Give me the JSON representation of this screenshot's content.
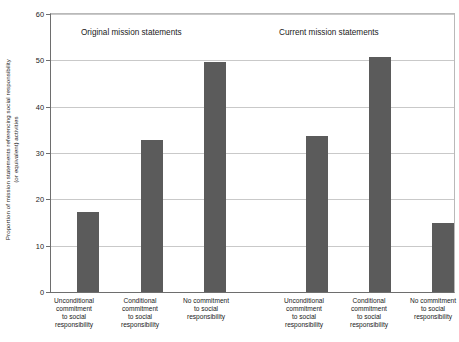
{
  "chart_data": {
    "type": "bar",
    "title": "",
    "xlabel": "",
    "ylabel_line1": "Proportion of mission statements referencing social responsibility",
    "ylabel_line2": "(or equivalent) activities",
    "ylim": [
      0,
      60
    ],
    "yticks": [
      0,
      10,
      20,
      30,
      40,
      50,
      60
    ],
    "ytick_labels": [
      "0",
      "10",
      "20",
      "30",
      "40",
      "50",
      "60"
    ],
    "grid": true,
    "legend": "none",
    "bar_color": "#5b5b5b",
    "grid_color": "#c9c9c9",
    "axis_color": "#6e6e6e",
    "groups": [
      {
        "name": "original",
        "title": "Original mission statements",
        "categories": [
          "Unconditional commitment to social responsibility",
          "Conditional commitment to social responsibility",
          "No commitment to social responsibility"
        ],
        "values": [
          17.3,
          32.9,
          49.6
        ]
      },
      {
        "name": "current",
        "title": "Current mission statements",
        "categories": [
          "Unconditional commitment to social responsibility",
          "Conditional commitment to social responsibility",
          "No commitment to social responsibility"
        ],
        "values": [
          33.6,
          50.8,
          14.9
        ]
      }
    ],
    "categories_flat": [
      "Unconditional commitment to social responsibility",
      "Conditional commitment to social responsibility",
      "No commitment to social responsibility",
      "Unconditional commitment to social responsibility",
      "Conditional commitment to social responsibility",
      "No commitment to social responsibility"
    ],
    "values_flat": [
      17.3,
      32.9,
      49.6,
      33.6,
      50.8,
      14.9
    ]
  },
  "labels": {
    "cat1_l1": "Unconditional",
    "cat1_l2": "commitment",
    "cat1_l3": "to social",
    "cat1_l4": "responsibility",
    "cat2_l1": "Conditional",
    "cat2_l2": "commitment",
    "cat2_l3": "to social",
    "cat2_l4": "responsibility",
    "cat3_l1": "No commitment",
    "cat3_l2": "to social",
    "cat3_l3": "responsibility",
    "cat3_l4": ""
  },
  "ytick_values": {
    "t0": "0",
    "t1": "10",
    "t2": "20",
    "t3": "30",
    "t4": "40",
    "t5": "50",
    "t6": "60"
  },
  "group_titles": {
    "left": "Original mission statements",
    "right": "Current mission statements"
  }
}
